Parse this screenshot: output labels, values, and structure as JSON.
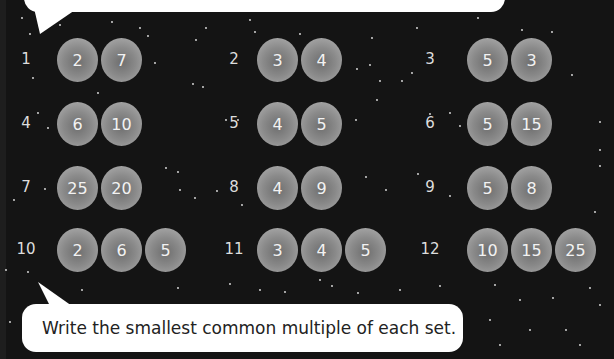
{
  "instruction": "Write the smallest common multiple of each set.",
  "problems": [
    {
      "number": "1",
      "values": [
        "2",
        "7"
      ]
    },
    {
      "number": "2",
      "values": [
        "3",
        "4"
      ]
    },
    {
      "number": "3",
      "values": [
        "5",
        "3"
      ]
    },
    {
      "number": "4",
      "values": [
        "6",
        "10"
      ]
    },
    {
      "number": "5",
      "values": [
        "4",
        "5"
      ]
    },
    {
      "number": "6",
      "values": [
        "5",
        "15"
      ]
    },
    {
      "number": "7",
      "values": [
        "25",
        "20"
      ]
    },
    {
      "number": "8",
      "values": [
        "4",
        "9"
      ]
    },
    {
      "number": "9",
      "values": [
        "5",
        "8"
      ]
    },
    {
      "number": "10",
      "values": [
        "2",
        "6",
        "5"
      ]
    },
    {
      "number": "11",
      "values": [
        "3",
        "4",
        "5"
      ]
    },
    {
      "number": "12",
      "values": [
        "10",
        "15",
        "25"
      ]
    }
  ],
  "colors": {
    "background": "#141414",
    "bubble": "#ffffff",
    "ball": "#9a9a9a",
    "text": "#dddddd"
  }
}
